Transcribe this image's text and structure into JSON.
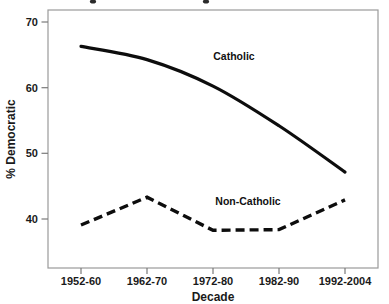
{
  "chart_data": {
    "type": "line",
    "title": "",
    "xlabel": "Decade",
    "ylabel": "% Democratic",
    "categories": [
      "1952-60",
      "1962-70",
      "1972-80",
      "1982-90",
      "1992-2004"
    ],
    "series": [
      {
        "name": "Catholic",
        "style": "solid",
        "color": "#0d0d0d",
        "values": [
          67.0,
          65.0,
          61.0,
          55.0,
          48.0
        ]
      },
      {
        "name": "Non-Catholic",
        "style": "dashed",
        "color": "#0d0d0d",
        "values": [
          40.0,
          44.2,
          39.2,
          39.3,
          43.8
        ]
      }
    ],
    "ylim": [
      33.5,
      72.5
    ],
    "yticks": [
      40,
      50,
      60,
      70
    ],
    "ytick_labels": [
      "40",
      "50",
      "60",
      "70"
    ],
    "grid": false,
    "legend_position": "inline-annotations",
    "annotations": [
      {
        "text": "Catholic",
        "x": 234,
        "y": 60
      },
      {
        "text": "Non-Catholic",
        "x": 248,
        "y": 205
      }
    ]
  },
  "axes": {
    "x_title": "Decade",
    "y_title": "% Democratic"
  },
  "frame": {
    "left": 48,
    "right": 378,
    "top": 10,
    "bottom": 268,
    "border_color": "#9a9a9a"
  }
}
